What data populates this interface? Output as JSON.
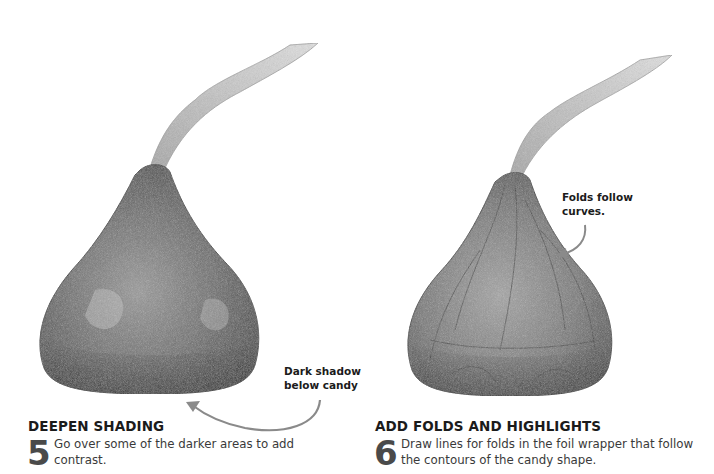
{
  "steps": [
    {
      "number": "5",
      "title": "DEEPEN SHADING",
      "text_line1": "Go over some of the darker areas to add",
      "text_line2": "contrast.",
      "callout_line1": "Dark shadow",
      "callout_line2": "below candy",
      "illustration": "pencil-drawn-chocolate-kiss-deepened-shading"
    },
    {
      "number": "6",
      "title": "ADD FOLDS AND HIGHLIGHTS",
      "text_line1": "Draw lines for folds in the foil wrapper that follow",
      "text_line2": "the contours of the candy shape.",
      "callout_line1": "Folds follow",
      "callout_line2": "curves.",
      "illustration": "pencil-drawn-chocolate-kiss-with-folds"
    }
  ],
  "colors": {
    "background": "#ffffff",
    "text": "#1b1b1b",
    "step_number": "#4a4a4a",
    "arrow": "#8a8a8a",
    "pencil_dark": "#3a3a3a",
    "pencil_mid": "#7a7a7a",
    "pencil_light": "#cfcfcf"
  }
}
